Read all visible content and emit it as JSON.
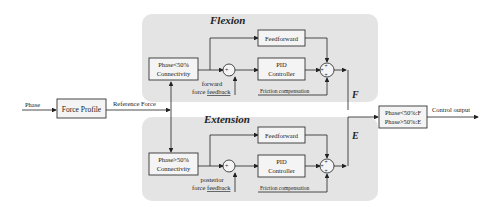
{
  "diagram": {
    "type": "control-block-diagram",
    "input": {
      "label": "Phase"
    },
    "force_profile": {
      "label": "Force Profile",
      "output_label": "Reference Force"
    },
    "panels": [
      {
        "title": "Flexion",
        "connectivity": {
          "line1": "Phase<50%",
          "line2": "Connectivity"
        },
        "feedback_label_1": "forward",
        "feedback_label_2": "force ",
        "feedback_label_3": "feedback",
        "feedforward": "Feedforward",
        "pid_line1": "PID",
        "pid_line2": "Controller",
        "friction": "Friction compensation",
        "output_symbol": "F"
      },
      {
        "title": "Extension",
        "connectivity": {
          "line1": "Phase>50%",
          "line2": "Connectivity"
        },
        "feedback_label_1": "posterior",
        "feedback_label_2": "force ",
        "feedback_label_3": "feedback",
        "feedforward": "Feedforward",
        "pid_line1": "PID",
        "pid_line2": "Controller",
        "friction": "Friction compensation",
        "output_symbol": "E"
      }
    ],
    "selector": {
      "line1": "Phase<50%:F",
      "line2": "Phase>50%:E"
    },
    "output": {
      "label": "Control output"
    },
    "colors": {
      "panel": "#e4e4e4",
      "line": "#222222",
      "box": "#f4f4f4"
    }
  }
}
